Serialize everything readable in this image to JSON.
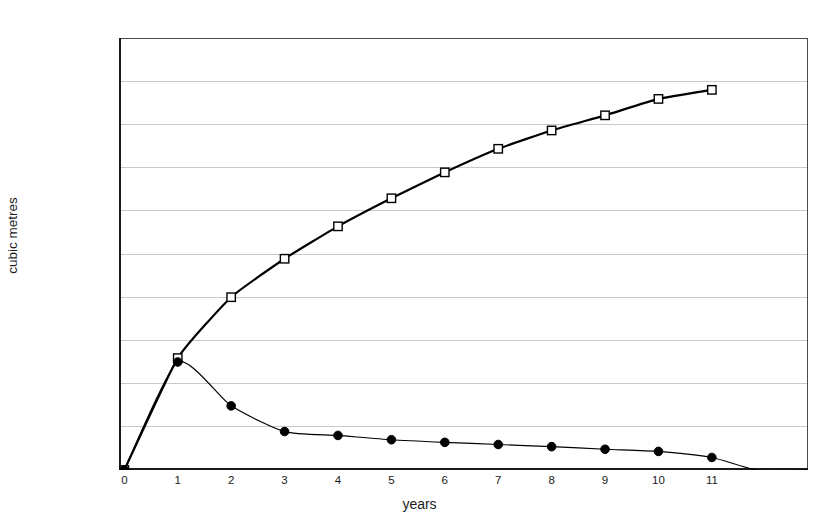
{
  "chart_data": {
    "type": "line",
    "title": "",
    "xlabel": "years",
    "ylabel": "cubic metres",
    "xlim": [
      -0.1,
      12.8
    ],
    "ylim": [
      0,
      2000000
    ],
    "grid": true,
    "legend_position": "none",
    "x_ticks": [
      0,
      1,
      2,
      3,
      4,
      5,
      6,
      7,
      8,
      9,
      10,
      11
    ],
    "x_tick_labels": [
      "0",
      "1",
      "2",
      "3",
      "4",
      "5",
      "6",
      "7",
      "8",
      "9",
      "10",
      "11"
    ],
    "y_ticks": [
      0,
      200000,
      400000,
      600000,
      800000,
      1000000,
      1200000,
      1400000,
      1600000,
      1800000,
      2000000
    ],
    "y_tick_labels": [
      "0.00",
      "200,000.00",
      "400,000.00",
      "600,000.00",
      "800,000.00",
      "1,000,000.00",
      "1,200,000.00",
      "1,400,000.00",
      "1,600,000.00",
      "1,800,000.00",
      "2,000,000.00"
    ],
    "series": [
      {
        "name": "cumulative",
        "marker": "open-square",
        "line_width": 2.2,
        "color": "#000000",
        "x": [
          0,
          1,
          2,
          3,
          4,
          5,
          6,
          7,
          8,
          9,
          10,
          11
        ],
        "values": [
          0,
          518000,
          800000,
          978000,
          1128000,
          1258000,
          1378000,
          1487000,
          1572000,
          1642000,
          1718000,
          1760000
        ]
      },
      {
        "name": "annual",
        "marker": "filled-circle",
        "line_width": 1.2,
        "color": "#000000",
        "x": [
          0,
          1,
          2,
          3,
          4,
          5,
          6,
          7,
          8,
          9,
          10,
          11,
          11.85,
          12.8
        ],
        "values": [
          0,
          500000,
          297000,
          178000,
          160000,
          140000,
          128000,
          118000,
          108000,
          96000,
          86000,
          58000,
          0,
          0
        ]
      }
    ]
  }
}
